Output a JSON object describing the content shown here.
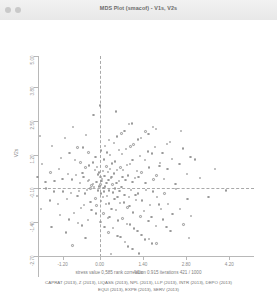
{
  "window": {
    "title": "MDS Plot (smacof) - V1s, V2s",
    "controls": [
      {
        "name": "close-button",
        "color": "#c9c9c9"
      },
      {
        "name": "minimize-button",
        "color": "#c9c9c9"
      }
    ]
  },
  "footer": {
    "stress_line": "stress value  0,585   rank correlation  0.915   iterations  421  /  1000",
    "legend_line_1": "CAPRAT (2013), Z (2013), LIQASS (2013), NPL (2013), LLP (2013), INTR (2013), DEPO (2013)",
    "legend_line_2": "EQUI (2013), EXPE (2013), SERV (2013)"
  },
  "chart_data": {
    "type": "scatter",
    "title": "MDS Plot (smacof) - V1s, V2s",
    "xlabel": "V1s",
    "ylabel": "V2s",
    "xlim": [
      -2.0,
      5.0
    ],
    "ylim": [
      -2.7,
      5.0
    ],
    "xticks": [
      -1.2,
      0.0,
      1.4,
      2.8,
      4.2
    ],
    "xticklabels": [
      "-1.20",
      "0.00",
      "1.40",
      "2.80",
      "4.20"
    ],
    "yticks": [
      -2.7,
      -1.4,
      -0.1,
      1.2,
      2.5,
      3.8,
      5.0
    ],
    "yticklabels": [
      "-2.70",
      "-1.40",
      "-0.10",
      "1.20",
      "2.50",
      "3.80",
      "5.00"
    ],
    "grid": false,
    "legend": "none",
    "marker": {
      "shape": "circle",
      "color": "#9a9a9a",
      "size": 2.4
    },
    "reference_lines": {
      "vertical_x": 0.0,
      "horizontal_y": -0.1,
      "style": "dashed"
    },
    "stress_value": 0.585,
    "rank_correlation": 0.915,
    "iterations": 421,
    "max_iterations": 1000,
    "variables": [
      "CAPRAT",
      "Z",
      "LIQASS",
      "NPL",
      "LLP",
      "INTR",
      "DEPO",
      "EQUI",
      "EXPE",
      "SERV"
    ],
    "year": 2013,
    "n_points": 240,
    "points": [
      [
        0.02,
        0.05
      ],
      [
        0.12,
        -0.08
      ],
      [
        -0.1,
        0.14
      ],
      [
        0.22,
        0.1
      ],
      [
        -0.18,
        -0.05
      ],
      [
        0.08,
        0.26
      ],
      [
        0.3,
        -0.18
      ],
      [
        -0.26,
        0.02
      ],
      [
        0.16,
        0.38
      ],
      [
        0.42,
        0.06
      ],
      [
        -0.34,
        0.22
      ],
      [
        0.05,
        -0.3
      ],
      [
        0.36,
        0.3
      ],
      [
        -0.05,
        0.44
      ],
      [
        0.5,
        -0.1
      ],
      [
        0.24,
        -0.38
      ],
      [
        -0.42,
        -0.16
      ],
      [
        0.62,
        0.18
      ],
      [
        0.1,
        0.58
      ],
      [
        -0.14,
        -0.48
      ],
      [
        0.46,
        0.48
      ],
      [
        0.7,
        -0.04
      ],
      [
        -0.52,
        0.34
      ],
      [
        0.33,
        0.66
      ],
      [
        0.84,
        0.22
      ],
      [
        -0.08,
        0.72
      ],
      [
        0.58,
        -0.44
      ],
      [
        -0.3,
        -0.62
      ],
      [
        0.92,
        0.4
      ],
      [
        0.2,
        -0.7
      ],
      [
        -0.64,
        0.1
      ],
      [
        0.76,
        0.62
      ],
      [
        1.02,
        -0.16
      ],
      [
        0.4,
        0.86
      ],
      [
        -0.22,
        0.9
      ],
      [
        0.66,
        -0.66
      ],
      [
        -0.72,
        -0.38
      ],
      [
        1.14,
        0.3
      ],
      [
        0.14,
        1.02
      ],
      [
        0.88,
        0.8
      ],
      [
        -0.46,
        0.7
      ],
      [
        1.24,
        -0.3
      ],
      [
        0.52,
        -0.92
      ],
      [
        -0.9,
        0.24
      ],
      [
        0.34,
        1.18
      ],
      [
        1.36,
        0.52
      ],
      [
        0.96,
        -0.78
      ],
      [
        -0.12,
        -1.06
      ],
      [
        1.06,
        1.0
      ],
      [
        -0.6,
        -0.86
      ],
      [
        1.48,
        0.12
      ],
      [
        0.72,
        1.22
      ],
      [
        -1.02,
        0.46
      ],
      [
        0.26,
        -1.24
      ],
      [
        1.6,
        0.7
      ],
      [
        1.18,
        -0.54
      ],
      [
        0.04,
        1.36
      ],
      [
        -0.8,
        1.0
      ],
      [
        1.3,
        1.16
      ],
      [
        0.6,
        -1.34
      ],
      [
        -1.18,
        -0.22
      ],
      [
        1.72,
        -0.22
      ],
      [
        0.86,
        1.42
      ],
      [
        -0.36,
        1.28
      ],
      [
        1.84,
        0.4
      ],
      [
        1.44,
        -0.96
      ],
      [
        0.18,
        1.54
      ],
      [
        -1.32,
        0.66
      ],
      [
        1.56,
        1.32
      ],
      [
        0.98,
        -1.48
      ],
      [
        -0.54,
        1.48
      ],
      [
        1.96,
        0.88
      ],
      [
        1.1,
        1.6
      ],
      [
        -1.46,
        0.18
      ],
      [
        0.44,
        -1.62
      ],
      [
        2.08,
        0.26
      ],
      [
        1.68,
        -1.2
      ],
      [
        -0.98,
        1.26
      ],
      [
        1.8,
        1.5
      ],
      [
        0.3,
        1.76
      ],
      [
        -1.6,
        0.52
      ],
      [
        2.2,
        0.66
      ],
      [
        1.22,
        -1.74
      ],
      [
        -0.7,
        -1.44
      ],
      [
        1.92,
        -0.72
      ],
      [
        0.56,
        1.9
      ],
      [
        -1.26,
        1.08
      ],
      [
        2.34,
        1.04
      ],
      [
        1.34,
        1.84
      ],
      [
        -1.74,
        -0.1
      ],
      [
        0.68,
        -1.98
      ],
      [
        2.46,
        0.08
      ],
      [
        2.04,
        1.26
      ],
      [
        -0.44,
        1.96
      ],
      [
        1.46,
        -2.06
      ],
      [
        -1.88,
        0.84
      ],
      [
        2.58,
        0.84
      ],
      [
        1.58,
        2.0
      ],
      [
        -1.1,
        -1.8
      ],
      [
        0.8,
        2.12
      ],
      [
        2.7,
        1.44
      ],
      [
        2.16,
        -1.58
      ],
      [
        -2.02,
        0.34
      ],
      [
        1.7,
        -2.22
      ],
      [
        0.92,
        -2.34
      ],
      [
        2.82,
        0.46
      ],
      [
        1.82,
        2.18
      ],
      [
        -1.54,
        1.54
      ],
      [
        2.94,
        1.12
      ],
      [
        2.28,
        1.7
      ],
      [
        -0.86,
        2.26
      ],
      [
        1.04,
        2.4
      ],
      [
        -0.02,
        -0.02
      ],
      [
        0.06,
        0.18
      ],
      [
        -0.06,
        -0.18
      ],
      [
        0.18,
        -0.02
      ],
      [
        -0.22,
        0.08
      ],
      [
        0.02,
        0.34
      ],
      [
        0.28,
        0.22
      ],
      [
        -0.3,
        -0.1
      ],
      [
        0.14,
        -0.22
      ],
      [
        0.38,
        0.34
      ],
      [
        -0.38,
        0.18
      ],
      [
        0.1,
        -0.42
      ],
      [
        0.44,
        -0.26
      ],
      [
        -0.02,
        0.52
      ],
      [
        0.54,
        0.12
      ],
      [
        0.26,
        0.54
      ],
      [
        -0.48,
        -0.3
      ],
      [
        0.64,
        -0.2
      ],
      [
        0.04,
        -0.58
      ],
      [
        -0.16,
        0.62
      ],
      [
        0.48,
        -0.5
      ],
      [
        0.74,
        0.34
      ],
      [
        -0.56,
        0.5
      ],
      [
        0.3,
        -0.68
      ],
      [
        0.8,
        -0.36
      ],
      [
        -0.1,
        -0.76
      ],
      [
        0.56,
        0.62
      ],
      [
        -0.34,
        0.78
      ],
      [
        0.94,
        -0.44
      ],
      [
        0.22,
        0.74
      ],
      [
        -0.68,
        -0.2
      ],
      [
        0.78,
        -0.64
      ],
      [
        1.06,
        0.16
      ],
      [
        0.38,
        -0.88
      ],
      [
        -0.26,
        -0.94
      ],
      [
        0.68,
        0.7
      ],
      [
        -0.76,
        0.42
      ],
      [
        1.16,
        -0.34
      ],
      [
        0.12,
        -1.06
      ],
      [
        0.9,
        -0.84
      ],
      [
        -0.5,
        -0.74
      ],
      [
        1.26,
        0.34
      ],
      [
        0.5,
        0.94
      ],
      [
        -0.94,
        -0.28
      ],
      [
        0.32,
        -1.2
      ],
      [
        1.38,
        -0.56
      ],
      [
        0.98,
        0.84
      ],
      [
        -0.14,
        1.1
      ],
      [
        1.08,
        -1.02
      ],
      [
        -0.62,
        0.9
      ],
      [
        1.5,
        -0.16
      ],
      [
        0.74,
        -1.26
      ],
      [
        -1.06,
        -0.5
      ],
      [
        0.24,
        1.28
      ],
      [
        1.62,
        -0.74
      ],
      [
        1.2,
        0.58
      ],
      [
        0.02,
        -1.4
      ],
      [
        -0.84,
        -1.04
      ],
      [
        1.32,
        -1.18
      ],
      [
        0.62,
        1.38
      ],
      [
        -1.2,
        0.26
      ],
      [
        1.74,
        0.24
      ],
      [
        0.88,
        -1.46
      ],
      [
        -0.38,
        -1.32
      ],
      [
        1.86,
        -0.44
      ],
      [
        1.46,
        1.0
      ],
      [
        0.16,
        -1.58
      ],
      [
        -1.36,
        -0.7
      ],
      [
        1.58,
        -1.36
      ],
      [
        1.0,
        1.52
      ],
      [
        -0.58,
        -1.52
      ],
      [
        1.98,
        -0.9
      ],
      [
        1.12,
        -1.64
      ],
      [
        -1.48,
        -0.22
      ],
      [
        0.46,
        1.66
      ],
      [
        2.1,
        -0.3
      ],
      [
        1.7,
        1.24
      ],
      [
        -1.0,
        -1.3
      ],
      [
        1.82,
        -1.54
      ],
      [
        0.28,
        -1.8
      ],
      [
        -1.62,
        -0.56
      ],
      [
        2.22,
        -0.7
      ],
      [
        1.24,
        1.78
      ],
      [
        -0.72,
        1.48
      ],
      [
        1.94,
        0.76
      ],
      [
        0.58,
        -1.94
      ],
      [
        -1.28,
        -1.12
      ],
      [
        2.36,
        -1.08
      ],
      [
        1.36,
        -1.88
      ],
      [
        -1.76,
        0.14
      ],
      [
        0.7,
        2.02
      ],
      [
        2.48,
        -0.12
      ],
      [
        2.06,
        -1.3
      ],
      [
        -0.46,
        -2.0
      ],
      [
        1.48,
        2.1
      ],
      [
        -1.9,
        -0.88
      ],
      [
        2.6,
        -0.88
      ],
      [
        1.6,
        -2.04
      ],
      [
        -1.12,
        1.84
      ],
      [
        0.82,
        -2.16
      ],
      [
        2.72,
        -1.48
      ],
      [
        2.18,
        1.62
      ],
      [
        -2.04,
        -0.38
      ],
      [
        1.72,
        2.26
      ],
      [
        0.94,
        2.38
      ],
      [
        2.84,
        -0.5
      ],
      [
        1.84,
        -2.22
      ],
      [
        -1.56,
        -1.58
      ],
      [
        2.96,
        -1.16
      ],
      [
        2.3,
        -1.74
      ],
      [
        -0.88,
        -2.3
      ],
      [
        1.06,
        -2.44
      ],
      [
        3.26,
        0.3
      ],
      [
        3.52,
        -0.42
      ],
      [
        3.08,
        1.02
      ],
      [
        -2.3,
        0.72
      ],
      [
        -2.46,
        -0.52
      ],
      [
        0.0,
        3.1
      ],
      [
        0.36,
        -2.62
      ],
      [
        4.1,
        -0.18
      ],
      [
        -0.2,
        2.72
      ],
      [
        2.64,
        2.12
      ],
      [
        -1.94,
        1.92
      ],
      [
        1.28,
        -2.6
      ],
      [
        3.74,
        0.66
      ],
      [
        -2.62,
        0.12
      ],
      [
        0.52,
        2.86
      ],
      [
        2.9,
        -2.0
      ]
    ]
  }
}
